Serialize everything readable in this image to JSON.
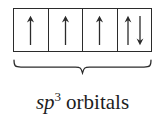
{
  "diagram": {
    "type": "orbital-box-diagram",
    "title_text": "sp3 orbitals",
    "colors": {
      "background": "#ffffff",
      "stroke": "#2b2b2b",
      "text": "#1d1d1d"
    },
    "orbitals": {
      "count": 4,
      "boxes": [
        {
          "index": 1,
          "electrons": 1,
          "spins": [
            "up"
          ],
          "label": "orbital-1-single-up"
        },
        {
          "index": 2,
          "electrons": 1,
          "spins": [
            "up"
          ],
          "label": "orbital-2-single-up"
        },
        {
          "index": 3,
          "electrons": 1,
          "spins": [
            "up"
          ],
          "label": "orbital-3-single-up"
        },
        {
          "index": 4,
          "electrons": 2,
          "spins": [
            "up",
            "down"
          ],
          "label": "orbital-4-paired"
        }
      ]
    },
    "brace": {
      "orientation": "underbrace",
      "spans_boxes": 4
    },
    "caption": {
      "symbol": "sp",
      "superscript": "3",
      "word": "orbitals",
      "full": "sp3 orbitals"
    }
  }
}
